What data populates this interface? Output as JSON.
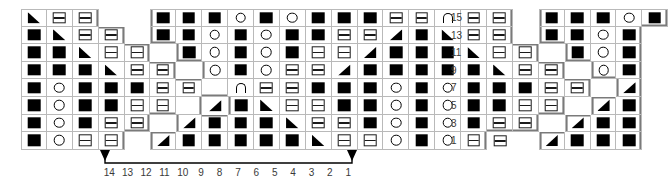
{
  "chart": {
    "type": "stitch-chart",
    "grid_columns": 27,
    "grid_rows": 8,
    "colors": {
      "symbol": "#000000",
      "gridline": "#b9b9b9",
      "outline": "#7a7a7a",
      "label": "#3a3a3a",
      "background": "#ffffff"
    },
    "legend_symbols": {
      "k": "filled-square",
      "p": "purl-rectangle",
      "o": "open-circle",
      "tne": "triangle-pointing-northeast",
      "tnw": "triangle-pointing-northwest",
      "a": "arc-cable",
      "b": "blank"
    },
    "row_numbers": [
      "15",
      "13",
      "11",
      "9",
      "7",
      "5",
      "3",
      "1"
    ],
    "column_numbers": [
      "14",
      "13",
      "12",
      "11",
      "10",
      "9",
      "8",
      "7",
      "6",
      "5",
      "4",
      "3",
      "2",
      "1"
    ],
    "repeat_bracket_label": "repeat section",
    "rows": [
      {
        "number": "15",
        "cells": [
          "tne",
          "p",
          "p",
          "b",
          "b",
          "k",
          "k",
          "k",
          "o",
          "k",
          "o",
          "k",
          "k",
          "k",
          "p",
          "p",
          "a",
          "p",
          "p",
          "b",
          "k",
          "k",
          "k",
          "o",
          "k",
          "b",
          "b"
        ]
      },
      {
        "number": "13",
        "cells": [
          "k",
          "tne",
          "p",
          "p",
          "b",
          "k",
          "k",
          "o",
          "k",
          "o",
          "k",
          "k",
          "p",
          "p",
          "tnw",
          "k",
          "tne",
          "p",
          "p",
          "b",
          "k",
          "k",
          "o",
          "k",
          "b",
          "b",
          "b"
        ]
      },
      {
        "number": "11",
        "cells": [
          "k",
          "k",
          "tne",
          "p",
          "p",
          "b",
          "k",
          "o",
          "k",
          "o",
          "k",
          "p",
          "p",
          "tnw",
          "k",
          "k",
          "k",
          "tne",
          "p",
          "p",
          "b",
          "k",
          "o",
          "k",
          "b",
          "b",
          "b"
        ]
      },
      {
        "number": "9",
        "cells": [
          "k",
          "k",
          "k",
          "tne",
          "p",
          "p",
          "b",
          "o",
          "k",
          "o",
          "p",
          "p",
          "tnw",
          "k",
          "k",
          "k",
          "k",
          "k",
          "tne",
          "p",
          "p",
          "b",
          "o",
          "k",
          "b",
          "b",
          "b"
        ]
      },
      {
        "number": "7",
        "cells": [
          "k",
          "o",
          "k",
          "k",
          "k",
          "p",
          "p",
          "b",
          "a",
          "p",
          "p",
          "k",
          "k",
          "k",
          "o",
          "k",
          "o",
          "k",
          "k",
          "k",
          "p",
          "p",
          "b",
          "tnw",
          "b",
          "b",
          "b"
        ]
      },
      {
        "number": "5",
        "cells": [
          "k",
          "o",
          "k",
          "k",
          "p",
          "p",
          "b",
          "tnw",
          "k",
          "tne",
          "p",
          "p",
          "k",
          "k",
          "o",
          "k",
          "o",
          "k",
          "k",
          "p",
          "p",
          "b",
          "tnw",
          "k",
          "b",
          "b",
          "b"
        ]
      },
      {
        "number": "3",
        "cells": [
          "k",
          "o",
          "k",
          "p",
          "p",
          "b",
          "tnw",
          "k",
          "k",
          "k",
          "tne",
          "p",
          "p",
          "k",
          "o",
          "k",
          "o",
          "k",
          "p",
          "p",
          "b",
          "tnw",
          "k",
          "k",
          "b",
          "b",
          "b"
        ]
      },
      {
        "number": "1",
        "cells": [
          "k",
          "o",
          "p",
          "p",
          "b",
          "tnw",
          "k",
          "k",
          "k",
          "k",
          "k",
          "tne",
          "p",
          "p",
          "o",
          "k",
          "o",
          "p",
          "p",
          "b",
          "tnw",
          "k",
          "k",
          "k",
          "b",
          "b",
          "b"
        ]
      }
    ],
    "occupancy": [
      [
        1,
        1,
        1,
        0,
        0,
        1,
        1,
        1,
        1,
        1,
        1,
        1,
        1,
        1,
        1,
        1,
        1,
        1,
        1,
        0,
        1,
        1,
        1,
        1,
        1,
        0,
        0
      ],
      [
        1,
        1,
        1,
        1,
        0,
        1,
        1,
        1,
        1,
        1,
        1,
        1,
        1,
        1,
        1,
        1,
        1,
        1,
        1,
        0,
        1,
        1,
        1,
        1,
        0,
        0,
        0
      ],
      [
        1,
        1,
        1,
        1,
        1,
        0,
        1,
        1,
        1,
        1,
        1,
        1,
        1,
        1,
        1,
        1,
        1,
        1,
        1,
        1,
        0,
        1,
        1,
        1,
        0,
        0,
        0
      ],
      [
        1,
        1,
        1,
        1,
        1,
        1,
        0,
        1,
        1,
        1,
        1,
        1,
        1,
        1,
        1,
        1,
        1,
        1,
        1,
        1,
        1,
        0,
        1,
        1,
        0,
        0,
        0
      ],
      [
        1,
        1,
        1,
        1,
        1,
        1,
        1,
        1,
        1,
        1,
        1,
        1,
        1,
        1,
        1,
        1,
        1,
        1,
        1,
        1,
        1,
        1,
        0,
        1,
        0,
        0,
        0
      ],
      [
        1,
        1,
        1,
        1,
        1,
        1,
        1,
        0,
        1,
        1,
        1,
        1,
        1,
        1,
        1,
        1,
        1,
        1,
        1,
        1,
        1,
        0,
        1,
        1,
        0,
        0,
        0
      ],
      [
        1,
        1,
        1,
        1,
        1,
        0,
        1,
        1,
        1,
        1,
        1,
        1,
        1,
        1,
        1,
        1,
        1,
        1,
        1,
        1,
        0,
        1,
        1,
        1,
        0,
        0,
        0
      ],
      [
        1,
        1,
        1,
        1,
        0,
        1,
        1,
        1,
        1,
        1,
        1,
        1,
        1,
        1,
        1,
        1,
        1,
        1,
        0,
        0,
        1,
        1,
        1,
        1,
        0,
        0,
        0
      ]
    ]
  }
}
